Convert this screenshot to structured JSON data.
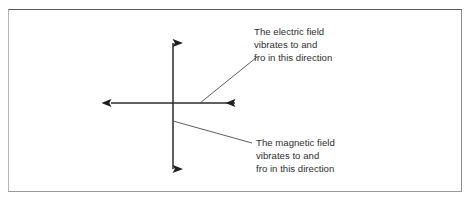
{
  "figure": {
    "name": "electromagnetic-wave-field-directions",
    "background_color": "#ffffff",
    "frame": {
      "border_color_top": "#5a5a5a",
      "border_color_left": "#b4b4b4",
      "border_color_right": "#8d8d8d",
      "border_color_bottom": "#9a9a9a"
    },
    "line_color": "#2b2b2b",
    "text_color": "#2f2f2f"
  },
  "annotations": {
    "electric": {
      "label": "The electric field\nvibrates to and\nfro in this direction",
      "lines": [
        "The electric field",
        "vibrates to and",
        "fro in this direction"
      ]
    },
    "magnetic": {
      "label": "The magnetic field\nvibrates to and\nfro in this direction",
      "lines": [
        "The magnetic field",
        "vibrates to and",
        "fro in this direction"
      ]
    }
  },
  "diagram": {
    "type": "vector-axes",
    "origin": {
      "x": 173,
      "y": 103
    },
    "arrows": [
      {
        "name": "vertical-double-arrow",
        "represents": "electric-field-direction",
        "x1": 173,
        "y1": 42,
        "x2": 173,
        "y2": 170,
        "heads": "both"
      },
      {
        "name": "horizontal-double-arrow",
        "represents": "magnetic-field-direction",
        "x1": 110,
        "y1": 103,
        "x2": 236,
        "y2": 103,
        "heads": "both"
      }
    ],
    "leader_lines": [
      {
        "name": "electric-leader-line",
        "x1": 200,
        "y1": 103,
        "x2": 257,
        "y2": 57
      },
      {
        "name": "magnetic-leader-line",
        "x1": 173,
        "y1": 121,
        "x2": 252,
        "y2": 143
      }
    ]
  }
}
